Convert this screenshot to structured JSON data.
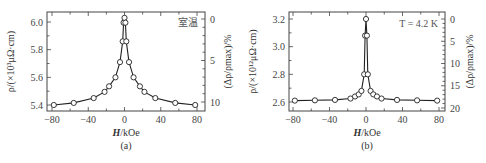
{
  "chart_data": [
    {
      "type": "line",
      "panel_label": "(a)",
      "title": "",
      "annotation": "室温",
      "xlabel": "H/kOe",
      "ylabel": "ρ/(×10³ μΩ·cm)",
      "y2label": "(Δρ/ρmax)/%",
      "xlim": [
        -85,
        85
      ],
      "ylim": [
        5.37,
        6.07
      ],
      "xticks": [
        -80,
        -40,
        0,
        40,
        80
      ],
      "yticks": [
        5.4,
        5.6,
        5.8,
        6.0
      ],
      "y2ticks": [
        0,
        5,
        10
      ],
      "grid": false,
      "marker": "open-circle",
      "x": [
        -78,
        -56,
        -34,
        -22,
        -17,
        -10,
        -5,
        -2,
        -1,
        0,
        1,
        2,
        5,
        10,
        17,
        22,
        34,
        56,
        78
      ],
      "values": [
        5.4,
        5.415,
        5.45,
        5.495,
        5.535,
        5.6,
        5.71,
        5.86,
        5.995,
        6.03,
        5.995,
        5.86,
        5.71,
        5.6,
        5.535,
        5.495,
        5.45,
        5.415,
        5.4
      ]
    },
    {
      "type": "line",
      "panel_label": "(b)",
      "title": "",
      "annotation": "T = 4.2 K",
      "xlabel": "H/kOe",
      "ylabel": "ρ/(×10¹² μΩ·cm)",
      "y2label": "(Δρ/ρmax)/%",
      "xlim": [
        -85,
        85
      ],
      "ylim": [
        2.57,
        3.25
      ],
      "xticks": [
        -80,
        -40,
        0,
        40,
        80
      ],
      "yticks": [
        2.6,
        2.8,
        3.0,
        3.2
      ],
      "y2ticks": [
        0,
        5,
        10,
        15,
        20
      ],
      "grid": false,
      "marker": "open-circle",
      "x": [
        -78,
        -56,
        -34,
        -17,
        -12,
        -8,
        -5,
        -2,
        -1,
        0,
        1,
        2,
        5,
        8,
        12,
        17,
        34,
        56,
        78
      ],
      "values": [
        2.61,
        2.612,
        2.615,
        2.625,
        2.64,
        2.655,
        2.68,
        2.8,
        3.08,
        3.2,
        3.08,
        2.8,
        2.68,
        2.655,
        2.64,
        2.625,
        2.615,
        2.612,
        2.61
      ]
    }
  ],
  "labels": {
    "a": {
      "panel": "(a)",
      "annotation": "室温",
      "xlabel_var": "H",
      "xlabel_unit": "/kOe",
      "ylabel": "ρ/(×10³μΩ·cm)",
      "y2label": "(Δρ/ρmax)/%"
    },
    "b": {
      "panel": "(b)",
      "annotation": "T = 4.2 K",
      "xlabel_var": "H",
      "xlabel_unit": "/kOe",
      "ylabel": "ρ/(×10¹²μΩ·cm)",
      "y2label": "(Δρ/ρmax)/%"
    }
  }
}
